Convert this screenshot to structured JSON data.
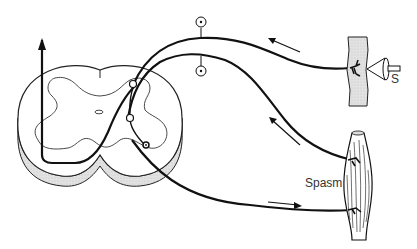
{
  "diagram": {
    "type": "reflex-arc",
    "labels": {
      "stimulus": "S",
      "muscle": "Spasm"
    },
    "components": [
      {
        "name": "spinal-cord-cross-section"
      },
      {
        "name": "ascending-pathway-arrow"
      },
      {
        "name": "dorsal-root-ganglion-neuron"
      },
      {
        "name": "sympathetic-ganglion-neuron"
      },
      {
        "name": "interneuron"
      },
      {
        "name": "motor-neuron"
      },
      {
        "name": "skin-receptor"
      },
      {
        "name": "stimulus-probe"
      },
      {
        "name": "muscle-in-spasm"
      }
    ],
    "arrows": [
      {
        "name": "afferent-from-skin",
        "direction": "left"
      },
      {
        "name": "afferent-from-muscle",
        "direction": "up-left"
      },
      {
        "name": "efferent-to-muscle",
        "direction": "right"
      }
    ],
    "colors": {
      "stroke": "#111111",
      "shading": "#d8d8d8",
      "background": "#ffffff"
    }
  }
}
